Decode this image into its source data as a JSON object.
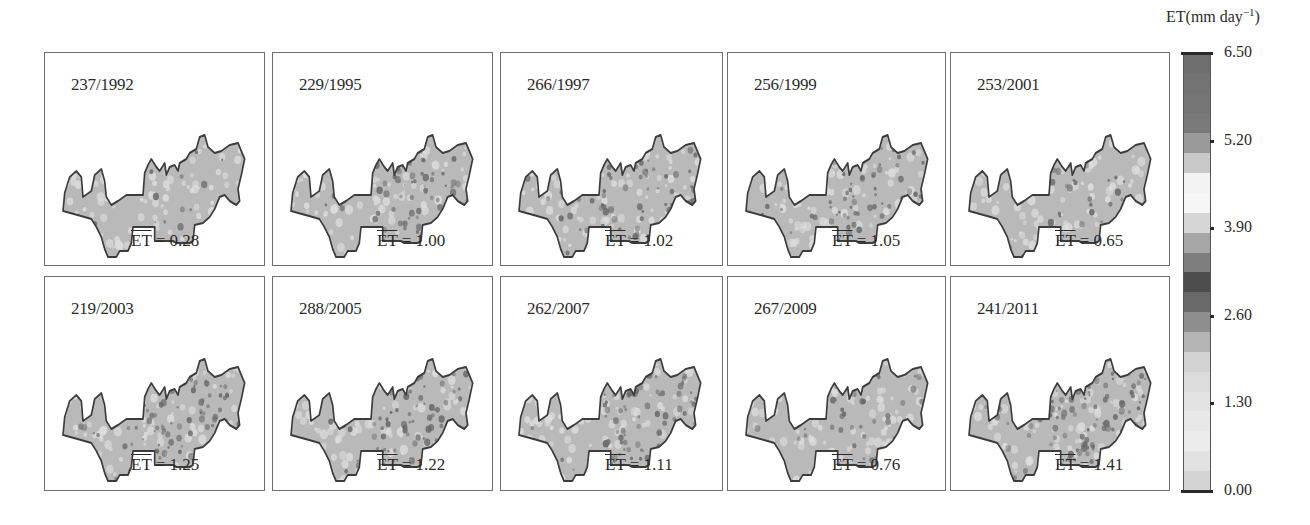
{
  "chart_data": {
    "type": "heatmap",
    "title": "",
    "colorbar": {
      "label": "ET(mm day⁻¹)",
      "label_main": "ET(mm day",
      "label_sup": "−1",
      "label_close": ")",
      "range": [
        0.0,
        6.5
      ],
      "ticks": [
        "6.50",
        "5.20",
        "3.90",
        "2.60",
        "1.30",
        "0.00"
      ],
      "bands_top_to_bottom": [
        "#6f6f6f",
        "#737373",
        "#767676",
        "#7a7a7a",
        "#9a9a9a",
        "#c8c8c8",
        "#f3f3f3",
        "#f6f6f6",
        "#d6d6d6",
        "#a7a7a7",
        "#7d7d7d",
        "#4d4d4d",
        "#6a6a6a",
        "#8e8e8e",
        "#b4b4b4",
        "#d2d2d2",
        "#dcdcdc",
        "#e3e3e3",
        "#e8e8e8",
        "#ececec",
        "#e2e2e2",
        "#d4d4d4"
      ]
    },
    "panels": [
      {
        "label": "237/1992",
        "doy": 237,
        "year": 1992,
        "mean_et": 0.28,
        "mean_text": "= 0.28",
        "intensity": 0.05
      },
      {
        "label": "229/1995",
        "doy": 229,
        "year": 1995,
        "mean_et": 1.0,
        "mean_text": "= 1.00",
        "intensity": 0.55
      },
      {
        "label": "266/1997",
        "doy": 266,
        "year": 1997,
        "mean_et": 1.02,
        "mean_text": "= 1.02",
        "intensity": 0.6
      },
      {
        "label": "256/1999",
        "doy": 256,
        "year": 1999,
        "mean_et": 1.05,
        "mean_text": "= 1.05",
        "intensity": 0.6
      },
      {
        "label": "253/2001",
        "doy": 253,
        "year": 2001,
        "mean_et": 0.65,
        "mean_text": "= 0.65",
        "intensity": 0.2
      },
      {
        "label": "219/2003",
        "doy": 219,
        "year": 2003,
        "mean_et": 1.25,
        "mean_text": "= 1.25",
        "intensity": 0.85
      },
      {
        "label": "288/2005",
        "doy": 288,
        "year": 2005,
        "mean_et": 1.22,
        "mean_text": "= 1.22",
        "intensity": 0.8
      },
      {
        "label": "262/2007",
        "doy": 262,
        "year": 2007,
        "mean_et": 1.11,
        "mean_text": "= 1.11",
        "intensity": 0.7
      },
      {
        "label": "267/2009",
        "doy": 267,
        "year": 2009,
        "mean_et": 0.76,
        "mean_text": "= 0.76",
        "intensity": 0.3
      },
      {
        "label": "241/2011",
        "doy": 241,
        "year": 2011,
        "mean_et": 1.41,
        "mean_text": "= 1.41",
        "intensity": 1.0
      }
    ],
    "mean_symbol": "ET",
    "layout": {
      "rows": 2,
      "cols": 5,
      "legend_position": "right"
    }
  },
  "colors": {
    "frame": "#6e6e6e",
    "region_base": "#b9b9b9",
    "region_outline": "#3c3c3c",
    "hotspot": "#6a6a6a",
    "lightspot": "#dedede"
  }
}
